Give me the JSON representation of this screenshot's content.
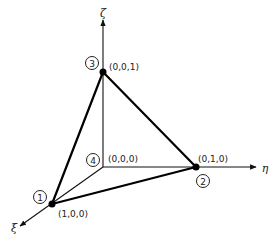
{
  "diagram": {
    "axes": {
      "zeta": {
        "label": "ζ",
        "x": 103,
        "y": 13,
        "from": [
          103,
          167
        ],
        "to": [
          103,
          20
        ]
      },
      "eta": {
        "label": "η",
        "x": 265,
        "y": 168,
        "from": [
          103,
          167
        ],
        "to": [
          256,
          167
        ]
      },
      "xi": {
        "label": "ξ",
        "x": 14,
        "y": 228,
        "from": [
          103,
          167
        ],
        "to": [
          20,
          226
        ]
      }
    },
    "nodes": [
      {
        "id": "1",
        "coord_label": "(1,0,0)",
        "x": 52,
        "y": 204,
        "badge": [
          40,
          197
        ],
        "label_pos": [
          58,
          216
        ]
      },
      {
        "id": "2",
        "coord_label": "(0,1,0)",
        "x": 196,
        "y": 167,
        "badge": [
          203,
          181
        ],
        "label_pos": [
          198,
          161
        ]
      },
      {
        "id": "3",
        "coord_label": "(0,0,1)",
        "x": 103,
        "y": 72,
        "badge": [
          92,
          63
        ],
        "label_pos": [
          108,
          69
        ]
      },
      {
        "id": "4",
        "coord_label": "(0,0,0)",
        "x": 103,
        "y": 167,
        "badge": [
          93,
          160
        ],
        "label_pos": [
          107,
          161
        ]
      }
    ],
    "edges_bold": [
      [
        "1",
        "2"
      ],
      [
        "2",
        "3"
      ],
      [
        "3",
        "1"
      ]
    ],
    "edges_thin": [
      [
        "4",
        "1"
      ],
      [
        "4",
        "2"
      ],
      [
        "4",
        "3"
      ]
    ]
  }
}
